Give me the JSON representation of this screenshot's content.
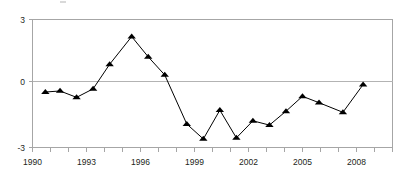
{
  "chart_data": {
    "type": "line",
    "title": "",
    "subtitle": "",
    "xlabel": "",
    "ylabel": "",
    "xlim": [
      1989.6,
      2009.2
    ],
    "ylim": [
      -3,
      3
    ],
    "yticks": [
      3,
      0,
      -3
    ],
    "ytick_labels": [
      "3",
      "0",
      "-3"
    ],
    "xticks": [
      1990,
      1993,
      1996,
      1999,
      2002,
      2005,
      2008
    ],
    "xtick_labels": [
      "1990",
      "1993",
      "1996",
      "1999",
      "2002",
      "2005",
      "2008"
    ],
    "grid": false,
    "zero_line": true,
    "legend": null,
    "marker": "triangle",
    "marker_color": "#000000",
    "line_color": "#000000",
    "axis_color": "#a6a6a6",
    "series": [
      {
        "name": "series-1",
        "x": [
          1990.3,
          1991.1,
          1992.0,
          1992.9,
          1993.8,
          1995.0,
          1995.9,
          1996.8,
          1998.0,
          1998.9,
          1999.8,
          2000.7,
          2001.6,
          2002.5,
          2003.4,
          2004.3,
          2005.2,
          2006.5,
          2007.6
        ],
        "values": [
          -0.4,
          -0.35,
          -0.65,
          -0.25,
          0.9,
          2.2,
          1.25,
          0.4,
          -1.9,
          -2.6,
          -1.25,
          -2.55,
          -1.75,
          -1.95,
          -1.3,
          -0.6,
          -0.9,
          -1.35,
          -0.05
        ]
      }
    ]
  },
  "axis": {
    "y_tick_top": "3",
    "y_tick_mid": "0",
    "y_tick_bottom": "-3",
    "x_tick_1": "1990",
    "x_tick_2": "1993",
    "x_tick_3": "1996",
    "x_tick_4": "1999",
    "x_tick_5": "2002",
    "x_tick_6": "2005",
    "x_tick_7": "2008"
  }
}
